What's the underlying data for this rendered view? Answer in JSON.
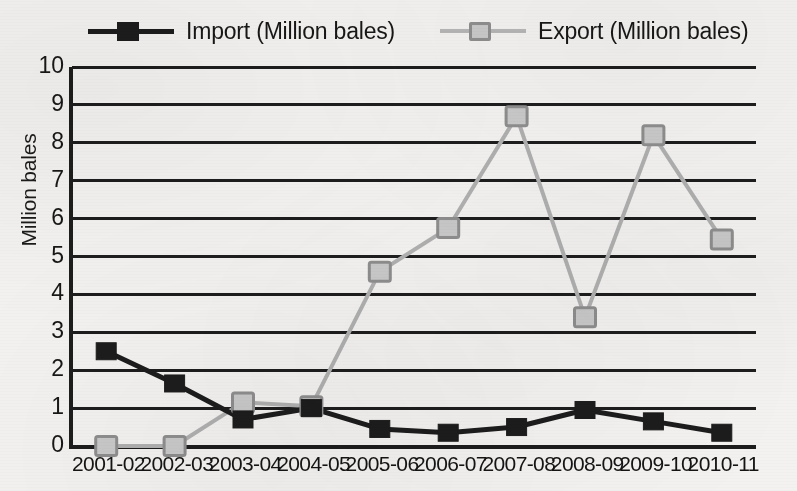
{
  "chart_data": {
    "type": "line",
    "title": "",
    "xlabel": "",
    "ylabel": "Million bales",
    "ylim": [
      0,
      10
    ],
    "ytick_step": 1,
    "grid": true,
    "legend_position": "top",
    "categories": [
      "2001-02",
      "2002-03",
      "2003-04",
      "2004-05",
      "2005-06",
      "2006-07",
      "2007-08",
      "2008-09",
      "2009-10",
      "2010-11"
    ],
    "yticks": [
      "10",
      "9",
      "8",
      "7",
      "6",
      "5",
      "4",
      "3",
      "2",
      "1",
      "0"
    ],
    "series": [
      {
        "name": "Import (Million bales)",
        "marker": "filled-square",
        "color": "#1c1c1c",
        "values": [
          2.5,
          1.65,
          0.7,
          1.0,
          0.45,
          0.35,
          0.5,
          0.95,
          0.65,
          0.35
        ]
      },
      {
        "name": "Export (Million bales)",
        "marker": "open-square",
        "color": "#b0b0b0",
        "values": [
          0.0,
          0.0,
          1.15,
          1.05,
          4.6,
          5.75,
          8.7,
          3.4,
          8.2,
          5.45
        ]
      }
    ]
  },
  "legend": {
    "items": [
      {
        "label": "Import (Million bales)",
        "color": "#1c1c1c",
        "marker": "filled-square"
      },
      {
        "label": "Export (Million bales)",
        "color": "#b6b6b6",
        "marker": "open-square"
      }
    ]
  },
  "colors": {
    "background": "#f3f2f0",
    "axis": "#1d1d1d",
    "import": "#1c1c1c",
    "export": "#b0b0b0",
    "export_marker_fill": "#c9c9c9",
    "text": "#171717"
  }
}
